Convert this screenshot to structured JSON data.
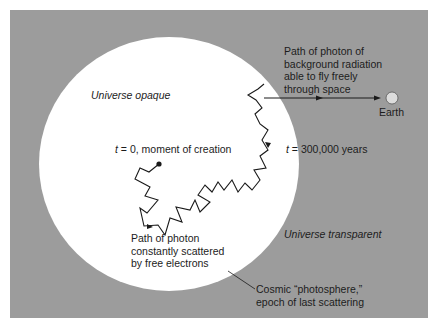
{
  "colors": {
    "background_panel": "#9c9c9c",
    "universe_circle": "#ffffff",
    "path_line": "#1a1a1a",
    "earth": "#dcdcdc"
  },
  "labels": {
    "universe_opaque": "Universe opaque",
    "t0_var": "t",
    "t0_rest": " = 0, moment of creation",
    "t300k_var": "t",
    "t300k_rest": " = 300,000 years",
    "free_path_1": "Path of photon of",
    "free_path_2": "background radiation",
    "free_path_3": "able to fly freely",
    "free_path_4": "through space",
    "earth": "Earth",
    "scattered_1": "Path of photon",
    "scattered_2": "constantly scattered",
    "scattered_3": "by free electrons",
    "universe_transparent": "Universe transparent",
    "photosphere_1": "Cosmic “photosphere,”",
    "photosphere_2": "epoch of last scattering"
  }
}
